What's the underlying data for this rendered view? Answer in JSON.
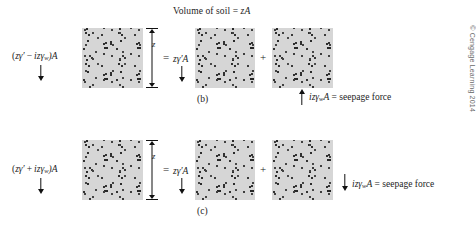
{
  "figure": {
    "title": "Volume of soil = zA",
    "title_parts": {
      "text": "Volume of soil = ",
      "variable": "zA"
    },
    "copyright": "© Cengage Learning 2014"
  },
  "rows": [
    {
      "id": "b",
      "caption": "(b)",
      "left_force": {
        "label": "(zγ′ − izγw)A",
        "open": "(",
        "term1": "zγ′",
        "operator": "−",
        "term2": "izγ",
        "subscript": "w",
        "close": ")A",
        "arrow": "down"
      },
      "dimension": {
        "label": "z"
      },
      "equals": "=",
      "middle_force": {
        "label": "zγ′A",
        "term": "zγ′A",
        "arrow": "down"
      },
      "plus": "+",
      "right_force": {
        "label": "izγwA = seepage force",
        "term": "izγ",
        "subscript": "w",
        "suffix": "A",
        "equals_text": " = seepage force",
        "arrow": "up"
      }
    },
    {
      "id": "c",
      "caption": "(c)",
      "left_force": {
        "label": "(zγ′ + izγw)A",
        "open": "(",
        "term1": "zγ′",
        "operator": "+",
        "term2": "izγ",
        "subscript": "w",
        "close": ")A",
        "arrow": "down"
      },
      "dimension": {
        "label": "z"
      },
      "equals": "=",
      "middle_force": {
        "label": "zγ′A",
        "term": "zγ′A",
        "arrow": "down"
      },
      "plus": "+",
      "right_force": {
        "label": "izγwA = seepage force",
        "term": "izγ",
        "subscript": "w",
        "suffix": "A",
        "equals_text": " = seepage force",
        "arrow": "down"
      }
    }
  ],
  "colors": {
    "soil_fill": "#d6d6d6",
    "soil_grain": "#2e2e2e",
    "ink": "#1d1d1d",
    "copyright_gray": "#6a6a6a"
  }
}
